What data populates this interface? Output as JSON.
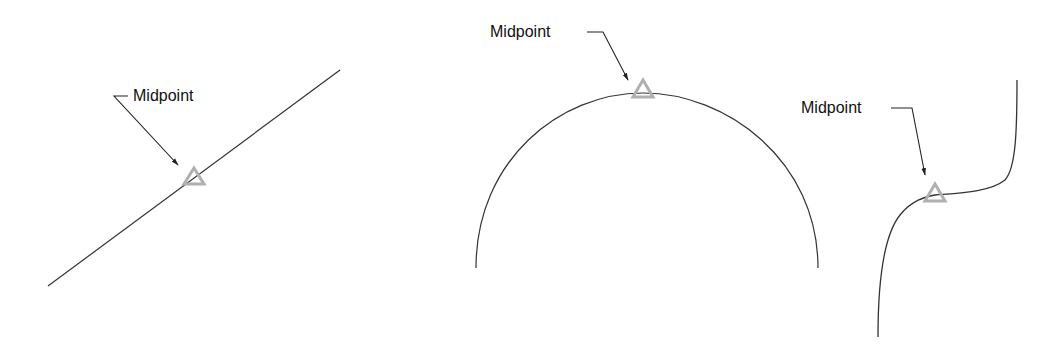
{
  "diagram": {
    "title": "",
    "colors": {
      "background": "#ffffff",
      "curve": "#333333",
      "marker": "#b0b0b0",
      "leader": "#222222",
      "text": "#111111"
    },
    "panels": [
      {
        "id": "line",
        "object_type": "straight line",
        "label": "Midpoint",
        "marker": "triangle"
      },
      {
        "id": "arc",
        "object_type": "arc",
        "label": "Midpoint",
        "marker": "triangle"
      },
      {
        "id": "spline",
        "object_type": "spline curve",
        "label": "Midpoint",
        "marker": "triangle"
      }
    ]
  }
}
